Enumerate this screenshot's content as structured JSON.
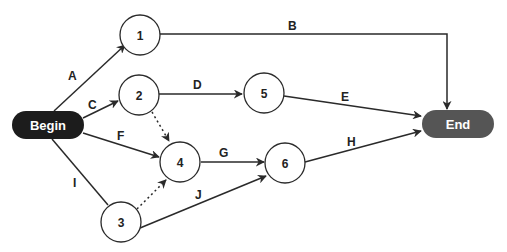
{
  "diagram": {
    "title": "",
    "type": "activity-on-arrow network",
    "colors": {
      "begin_fill": "#1c1c1c",
      "end_fill": "#555555",
      "line": "#2a2a2a",
      "node_fill": "#ffffff"
    },
    "terminals": {
      "begin": {
        "label": "Begin"
      },
      "end": {
        "label": "End"
      }
    },
    "nodes": [
      {
        "id": "1",
        "label": "1"
      },
      {
        "id": "2",
        "label": "2"
      },
      {
        "id": "3",
        "label": "3"
      },
      {
        "id": "4",
        "label": "4"
      },
      {
        "id": "5",
        "label": "5"
      },
      {
        "id": "6",
        "label": "6"
      }
    ],
    "edges": [
      {
        "label": "A",
        "from": "Begin",
        "to": "1",
        "style": "solid"
      },
      {
        "label": "B",
        "from": "1",
        "to": "End",
        "style": "solid"
      },
      {
        "label": "C",
        "from": "Begin",
        "to": "2",
        "style": "solid"
      },
      {
        "label": "D",
        "from": "2",
        "to": "5",
        "style": "solid"
      },
      {
        "label": "E",
        "from": "5",
        "to": "End",
        "style": "solid"
      },
      {
        "label": "F",
        "from": "Begin",
        "to": "4",
        "style": "solid"
      },
      {
        "label": "G",
        "from": "4",
        "to": "6",
        "style": "solid"
      },
      {
        "label": "H",
        "from": "6",
        "to": "End",
        "style": "solid"
      },
      {
        "label": "I",
        "from": "Begin",
        "to": "3",
        "style": "solid"
      },
      {
        "label": "J",
        "from": "3",
        "to": "6",
        "style": "solid"
      },
      {
        "label": "",
        "from": "2",
        "to": "4",
        "style": "dashed",
        "kind": "dummy"
      },
      {
        "label": "",
        "from": "3",
        "to": "4",
        "style": "dashed",
        "kind": "dummy"
      }
    ]
  }
}
